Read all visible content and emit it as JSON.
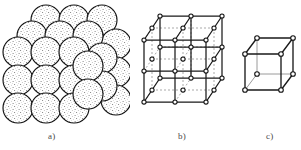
{
  "figure": {
    "background_color": "#ffffff",
    "ink_color": "#1a1a1a",
    "stipple_color": "#6b6b6b",
    "hidden_line_color": "#9a9a9a",
    "width_px": 301,
    "height_px": 150
  },
  "panels": [
    {
      "id": "a",
      "caption": "a)",
      "kind": "sphere-packing-model",
      "description": "Close-packed stippled spheres stacked in a cubic arrangement",
      "sphere_rows": 4,
      "sphere_columns": 4,
      "sphere_radius_px": 15,
      "sphere_fill": "#ffffff",
      "sphere_outline": "#111111"
    },
    {
      "id": "b",
      "caption": "b)",
      "kind": "lattice-cube-subdivided",
      "description": "Cubic lattice subdivided 2x2x2 with nodes at every lattice point",
      "divisions": 2,
      "nodes_total": 27,
      "node_radius_px": 2.1,
      "node_fill": "#ffffff",
      "node_outline": "#111111",
      "edge_color": "#1a1a1a",
      "hidden_edge_color": "#9a9a9a",
      "hidden_edge_dash": "2,2"
    },
    {
      "id": "c",
      "caption": "c)",
      "kind": "unit-cell-cube",
      "description": "Single unit cell cube with eight corner nodes",
      "divisions": 1,
      "nodes_total": 8,
      "node_radius_px": 2.3,
      "node_fill": "#ffffff",
      "node_outline": "#111111",
      "edge_color": "#1a1a1a",
      "hidden_edge_color": "#8f8f8f"
    }
  ]
}
